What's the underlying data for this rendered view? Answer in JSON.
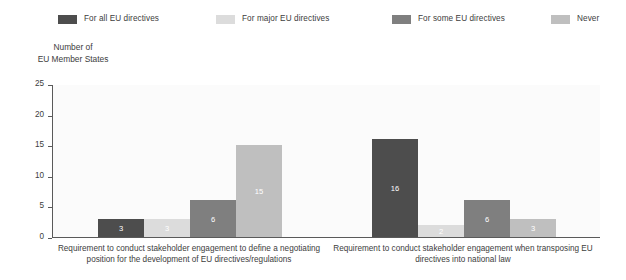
{
  "legend": {
    "items": [
      {
        "label": "For all EU directives",
        "color": "#4d4d4d"
      },
      {
        "label": "For major EU directives",
        "color": "#dcdcdc"
      },
      {
        "label": "For some EU directives",
        "color": "#7f7f7f"
      },
      {
        "label": "Never",
        "color": "#bfbfbf"
      }
    ]
  },
  "axis_title": {
    "line1": "Number of",
    "line2": "EU Member States"
  },
  "chart_data": {
    "type": "bar",
    "title": "",
    "subtitle": "",
    "xlabel": "",
    "ylabel": "Number of EU Member States",
    "ylim": [
      0,
      25
    ],
    "yticks": [
      "0",
      "5",
      "10",
      "15",
      "20",
      "25"
    ],
    "grid": false,
    "legend_position": "top",
    "categories": [
      "Requirement to conduct stakeholder engagement to define a negotiating position for the development of EU directives/regulations",
      "Requirement to conduct stakeholder engagement when transposing EU directives into national law"
    ],
    "series": [
      {
        "name": "For all EU directives",
        "color": "#4d4d4d",
        "values": [
          3,
          16
        ]
      },
      {
        "name": "For major EU directives",
        "color": "#dcdcdc",
        "values": [
          3,
          2
        ]
      },
      {
        "name": "For some EU directives",
        "color": "#7f7f7f",
        "values": [
          6,
          6
        ]
      },
      {
        "name": "Never",
        "color": "#bfbfbf",
        "values": [
          15,
          3
        ]
      }
    ],
    "data_labels": [
      [
        "3",
        "3",
        "6",
        "15"
      ],
      [
        "16",
        "2",
        "6",
        "3"
      ]
    ]
  }
}
